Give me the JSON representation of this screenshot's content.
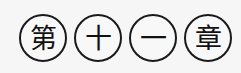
{
  "chapter_heading": {
    "characters": [
      "第",
      "十",
      "一",
      "章"
    ],
    "meaning": ""
  }
}
